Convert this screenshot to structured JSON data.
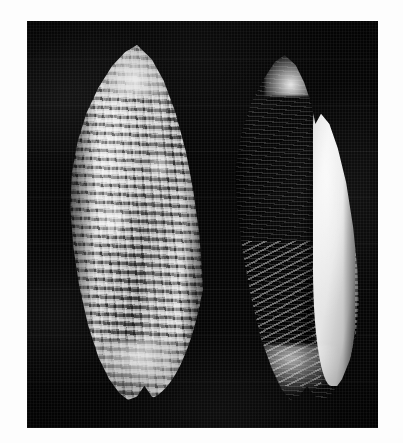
{
  "image": {
    "kind": "photograph",
    "subject": "two-seashells",
    "rendering": "black-and-white",
    "orientation": "portrait",
    "width_px": 403,
    "height_px": 443,
    "alt_text": "Black and white photograph of two elongate volute-like seashells lying side by side on a near-black cloth background."
  },
  "border": {
    "color": "#ffffff",
    "left_px": 27,
    "top_px": 21,
    "right_px": 25,
    "bottom_px": 15
  },
  "background": {
    "name": "dark-cloth-backdrop",
    "color": "#0a0a0a",
    "description": "near-black fabric with faint woven grain and soft lighter blotches"
  },
  "specimens": [
    {
      "id": "left-shell",
      "view": "dorsal",
      "surface": "beaded-cancellate-sculpture",
      "description": "Elongate fusiform shell seen from the back; pointed apex; surface covered by strong spiral cords crossed by axial ribs producing a grid of rectangular beads; a pale axial varix runs down the right of centre; base tapers to a notched siphonal canal.",
      "tone": "mid grey with bright highlights and deep shadowed grooves",
      "highlight_color": "#d0d0d0",
      "shadow_color": "#2a2a2a",
      "bounds_px": {
        "x": 36,
        "y": 24,
        "width": 148,
        "height": 355
      }
    },
    {
      "id": "right-shell",
      "view": "ventral-aperture",
      "surface": "smooth-with-fine-striae",
      "description": "Same species seen from the front; narrow elongate aperture running almost the full length; thickened outer lip on the right with a crenulated, beaded margin; oblique columellar plaits on the lower left; surface otherwise smooth and pale cream-white.",
      "tone": "pale cream-white, brightest object in the frame",
      "highlight_color": "#ece8e1",
      "shadow_color": "#3a3836",
      "bounds_px": {
        "x": 196,
        "y": 34,
        "width": 140,
        "height": 345
      }
    }
  ],
  "palette": {
    "paper_white": "#ffffff",
    "backdrop_black": "#0a0a0a",
    "shell_highlight": "#ececec",
    "shell_midtone": "#a9a9a9",
    "shell_shadow": "#2a2a2a"
  },
  "caption": ""
}
